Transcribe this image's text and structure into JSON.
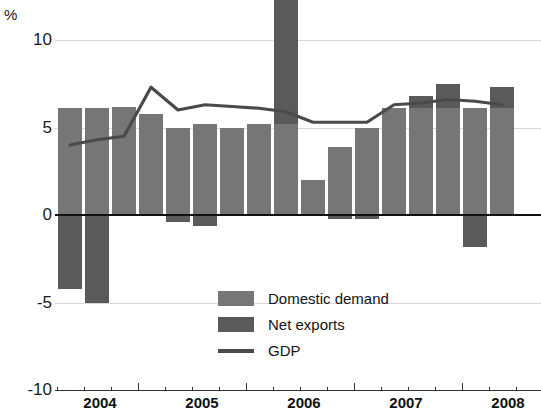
{
  "chart_data": {
    "type": "bar",
    "title": "",
    "subtitle": "",
    "xlabel": "",
    "ylabel": "%",
    "unit_label": "%",
    "ylim": [
      -10,
      10
    ],
    "yticks": [
      10,
      5,
      0,
      -5,
      -10
    ],
    "ytick_labels": [
      "10",
      "5",
      "0",
      "-5",
      "-10"
    ],
    "grid": true,
    "grid_lines_at": [
      10,
      5,
      -5
    ],
    "zero_line": true,
    "legend_position": "inside-bottom-center",
    "stacked": true,
    "x_major_tick_labels": [
      "2004",
      "2005",
      "2006",
      "2007",
      "2008"
    ],
    "x_minor_ticks_per_year": 4,
    "categories": [
      "2003 Q4",
      "2004 Q1",
      "2004 Q2",
      "2004 Q3",
      "2004 Q4",
      "2005 Q1",
      "2005 Q2",
      "2005 Q3",
      "2005 Q4",
      "2006 Q1",
      "2006 Q2",
      "2006 Q3",
      "2006 Q4",
      "2007 Q1",
      "2007 Q2",
      "2007 Q3",
      "2007 Q4"
    ],
    "series": [
      {
        "name": "Domestic demand",
        "color": "#767676",
        "values": [
          6.1,
          6.1,
          6.2,
          5.8,
          5.0,
          5.2,
          5.0,
          5.2,
          5.2,
          2.0,
          3.9,
          5.0,
          6.1,
          6.1,
          6.1,
          6.1,
          6.1
        ]
      },
      {
        "name": "Net exports",
        "color": "#5a5a5a",
        "values": [
          -4.2,
          -5.0,
          0.0,
          0.0,
          -0.4,
          -0.6,
          0.0,
          0.0,
          9.0,
          0.0,
          -0.2,
          -0.2,
          0.0,
          0.7,
          1.4,
          -1.8,
          1.2
        ]
      }
    ],
    "line_series": {
      "name": "GDP",
      "color": "#4a4a4a",
      "values": [
        4.0,
        4.3,
        4.5,
        7.3,
        6.0,
        6.3,
        6.2,
        6.1,
        5.9,
        5.3,
        5.3,
        5.3,
        6.3,
        6.4,
        6.6,
        6.5,
        6.3
      ]
    },
    "legend": [
      {
        "label": "Domestic demand",
        "marker": "swatch",
        "color": "#767676"
      },
      {
        "label": "Net exports",
        "marker": "swatch",
        "color": "#5a5a5a"
      },
      {
        "label": "GDP",
        "marker": "line",
        "color": "#4a4a4a"
      }
    ]
  }
}
